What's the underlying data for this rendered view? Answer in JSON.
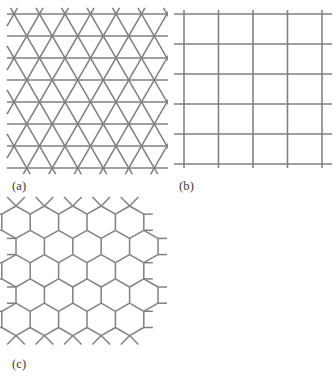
{
  "figure": {
    "background_color": "#ffffff",
    "line_color": "#808080",
    "label_color": "#3a3a3a",
    "panels": [
      {
        "id": "a",
        "label": "(a)",
        "lattice_name": "triangular-lattice",
        "description": "Triangular lattice formed by horizontal lines and two sets of diagonal lines",
        "geometry": {
          "origin_x": 14,
          "origin_y": 14,
          "columns": 6,
          "rows": 7,
          "row_spacing": 22,
          "col_spacing": 25.5,
          "stub": 7
        }
      },
      {
        "id": "b",
        "label": "(b)",
        "lattice_name": "square-lattice",
        "description": "Square lattice of horizontal and vertical lines",
        "geometry": {
          "origin_x": 16,
          "origin_y": 14,
          "vertical_lines": 5,
          "horizontal_lines": 6,
          "x_spacing": 34.5,
          "y_spacing": 30,
          "overhang": 10
        }
      },
      {
        "id": "c",
        "label": "(c)",
        "lattice_name": "honeycomb-lattice",
        "description": "Honeycomb (hexagonal) lattice of pointy-top hexagons with vertical side edges",
        "geometry": {
          "origin_x": 16,
          "origin_y": 12,
          "hex_radius": 16.2,
          "hex_half_width": 14.2,
          "columns": 5,
          "rows": 5,
          "stub": 9
        }
      }
    ]
  }
}
